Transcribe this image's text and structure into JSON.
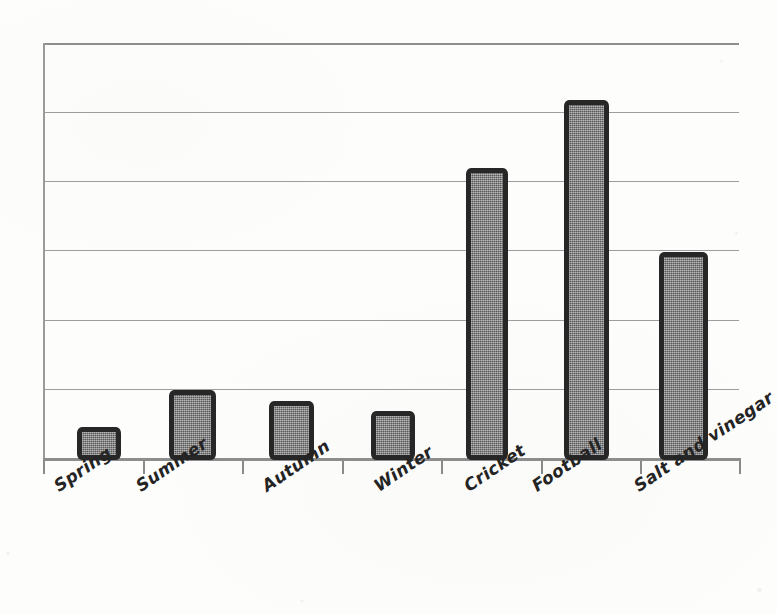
{
  "chart_data": {
    "type": "bar",
    "title": "",
    "subtitle": "",
    "xlabel": "",
    "ylabel": "",
    "categories": [
      "Spring",
      "Summer",
      "Autumn",
      "Winter",
      "Cricket",
      "Football",
      "Salt and vinegar"
    ],
    "values": [
      0.47,
      1.0,
      0.85,
      0.7,
      4.2,
      5.2,
      3.0
    ],
    "ylim": [
      0,
      6
    ],
    "yticks": [
      0,
      1,
      2,
      3,
      4,
      5,
      6
    ],
    "ytick_labels": [
      "",
      "",
      "",
      "",
      "",
      "",
      ""
    ],
    "grid": true,
    "grid_axis": "y",
    "legend": false,
    "legend_position": "none",
    "annotations": [],
    "series": [
      {
        "name": "",
        "values": [
          0.47,
          1.0,
          0.85,
          0.7,
          4.2,
          5.2,
          3.0
        ]
      }
    ],
    "style": {
      "bar_fill": "#6e6e6e",
      "bar_outline": "#272727",
      "gridline_color": "#9d9d9d",
      "axis_color": "#8d8d8d",
      "background": "#fdfdfc",
      "label_color": "#242424",
      "label_rotation": -34
    },
    "bar_geometry": [
      {
        "label": "Spring",
        "left": 77,
        "width": 44,
        "top": 427
      },
      {
        "label": "Summer",
        "left": 169,
        "width": 47,
        "top": 390
      },
      {
        "label": "Autumn",
        "left": 269,
        "width": 45,
        "top": 401
      },
      {
        "label": "Winter",
        "left": 371,
        "width": 44,
        "top": 411
      },
      {
        "label": "Cricket",
        "left": 466,
        "width": 42,
        "top": 168
      },
      {
        "label": "Football",
        "left": 564,
        "width": 45,
        "top": 100
      },
      {
        "label": "Salt and vinegar",
        "left": 659,
        "width": 49,
        "top": 252
      }
    ],
    "gridline_y": [
      43,
      112,
      181,
      250,
      320,
      389,
      458
    ],
    "tick_x": [
      43,
      143,
      242,
      342,
      441,
      541,
      640,
      739
    ],
    "label_positions": [
      {
        "x": 50,
        "y": 479
      },
      {
        "x": 132,
        "y": 479
      },
      {
        "x": 258,
        "y": 479
      },
      {
        "x": 370,
        "y": 479
      },
      {
        "x": 460,
        "y": 479
      },
      {
        "x": 528,
        "y": 479
      },
      {
        "x": 630,
        "y": 479
      }
    ]
  }
}
